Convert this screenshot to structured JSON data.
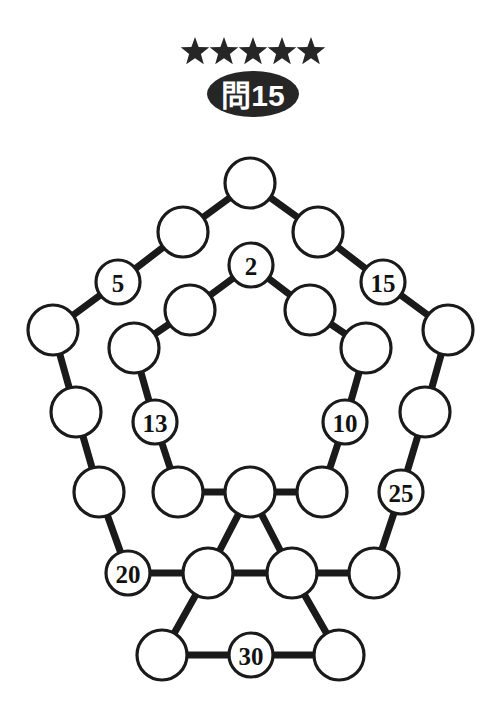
{
  "header": {
    "difficulty_stars": 5,
    "star_icon": "star-icon",
    "badge_label": "問15"
  },
  "puzzle": {
    "type": "number-circle-graph",
    "nodes": [
      {
        "id": "out-apex",
        "label": "",
        "x": 250,
        "y": 183,
        "r": 25
      },
      {
        "id": "out-ul1",
        "label": "",
        "x": 183,
        "y": 232,
        "r": 25
      },
      {
        "id": "out-ul2",
        "label": "5",
        "x": 118,
        "y": 282,
        "r": 22
      },
      {
        "id": "out-l1",
        "label": "",
        "x": 53,
        "y": 330,
        "r": 25
      },
      {
        "id": "out-l2",
        "label": "",
        "x": 76,
        "y": 412,
        "r": 25
      },
      {
        "id": "out-l3",
        "label": "",
        "x": 99,
        "y": 492,
        "r": 25
      },
      {
        "id": "out-l4",
        "label": "20",
        "x": 128,
        "y": 573,
        "r": 22
      },
      {
        "id": "out-ur1",
        "label": "",
        "x": 318,
        "y": 232,
        "r": 25
      },
      {
        "id": "out-ur2",
        "label": "15",
        "x": 383,
        "y": 282,
        "r": 22
      },
      {
        "id": "out-r1",
        "label": "",
        "x": 448,
        "y": 330,
        "r": 25
      },
      {
        "id": "out-r2",
        "label": "",
        "x": 425,
        "y": 412,
        "r": 25
      },
      {
        "id": "out-r3",
        "label": "25",
        "x": 401,
        "y": 492,
        "r": 22
      },
      {
        "id": "out-r4",
        "label": "",
        "x": 374,
        "y": 573,
        "r": 25
      },
      {
        "id": "in-apex",
        "label": "2",
        "x": 251,
        "y": 265,
        "r": 22
      },
      {
        "id": "in-ul1",
        "label": "",
        "x": 190,
        "y": 310,
        "r": 25
      },
      {
        "id": "in-ul2",
        "label": "",
        "x": 134,
        "y": 348,
        "r": 25
      },
      {
        "id": "in-l1",
        "label": "13",
        "x": 155,
        "y": 422,
        "r": 22
      },
      {
        "id": "in-l2",
        "label": "",
        "x": 178,
        "y": 492,
        "r": 25
      },
      {
        "id": "in-ur1",
        "label": "",
        "x": 310,
        "y": 310,
        "r": 25
      },
      {
        "id": "in-ur2",
        "label": "",
        "x": 366,
        "y": 348,
        "r": 25
      },
      {
        "id": "in-r1",
        "label": "10",
        "x": 345,
        "y": 422,
        "r": 22
      },
      {
        "id": "in-r2",
        "label": "",
        "x": 322,
        "y": 492,
        "r": 25
      },
      {
        "id": "center",
        "label": "",
        "x": 250,
        "y": 492,
        "r": 25
      },
      {
        "id": "tri-left",
        "label": "",
        "x": 208,
        "y": 573,
        "r": 25
      },
      {
        "id": "tri-right",
        "label": "",
        "x": 292,
        "y": 573,
        "r": 25
      },
      {
        "id": "bot-left",
        "label": "",
        "x": 162,
        "y": 655,
        "r": 25
      },
      {
        "id": "bot-mid",
        "label": "30",
        "x": 251,
        "y": 655,
        "r": 22
      },
      {
        "id": "bot-right",
        "label": "",
        "x": 339,
        "y": 655,
        "r": 25
      }
    ],
    "edges": [
      [
        "out-apex",
        "out-ul1"
      ],
      [
        "out-ul1",
        "out-ul2"
      ],
      [
        "out-ul2",
        "out-l1"
      ],
      [
        "out-l1",
        "out-l2"
      ],
      [
        "out-l2",
        "out-l3"
      ],
      [
        "out-l3",
        "out-l4"
      ],
      [
        "out-l4",
        "tri-left"
      ],
      [
        "out-apex",
        "out-ur1"
      ],
      [
        "out-ur1",
        "out-ur2"
      ],
      [
        "out-ur2",
        "out-r1"
      ],
      [
        "out-r1",
        "out-r2"
      ],
      [
        "out-r2",
        "out-r3"
      ],
      [
        "out-r3",
        "out-r4"
      ],
      [
        "out-r4",
        "tri-right"
      ],
      [
        "in-apex",
        "in-ul1"
      ],
      [
        "in-ul1",
        "in-ul2"
      ],
      [
        "in-ul2",
        "in-l1"
      ],
      [
        "in-l1",
        "in-l2"
      ],
      [
        "in-l2",
        "center"
      ],
      [
        "in-apex",
        "in-ur1"
      ],
      [
        "in-ur1",
        "in-ur2"
      ],
      [
        "in-ur2",
        "in-r1"
      ],
      [
        "in-r1",
        "in-r2"
      ],
      [
        "in-r2",
        "center"
      ],
      [
        "center",
        "tri-left"
      ],
      [
        "center",
        "tri-right"
      ],
      [
        "tri-left",
        "tri-right"
      ],
      [
        "tri-left",
        "bot-left"
      ],
      [
        "tri-right",
        "bot-right"
      ],
      [
        "bot-left",
        "bot-mid"
      ],
      [
        "bot-mid",
        "bot-right"
      ]
    ]
  },
  "colors": {
    "ink": "#1a1a1a",
    "badge_fill": "#262626",
    "page_background": "#ffffff"
  }
}
